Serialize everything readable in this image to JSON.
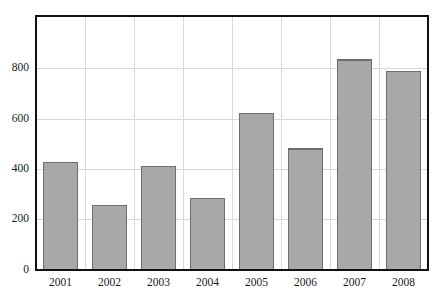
{
  "chart_data": {
    "type": "bar",
    "title": "",
    "subtitle": "",
    "xlabel": "",
    "ylabel": "",
    "categories": [
      "2001",
      "2002",
      "2003",
      "2004",
      "2005",
      "2006",
      "2007",
      "2008"
    ],
    "values": [
      428,
      256,
      412,
      284,
      622,
      480,
      836,
      790
    ],
    "series": [
      {
        "name": "",
        "values": [
          428,
          256,
          412,
          284,
          622,
          480,
          836,
          790
        ]
      }
    ],
    "ylim": [
      0,
      1010
    ],
    "yticks": [
      0,
      200,
      400,
      600,
      800
    ],
    "ytick_labels": [
      "0",
      "200",
      "400",
      "600",
      "800"
    ],
    "xtick_labels": [
      "2001",
      "2002",
      "2003",
      "2004",
      "2005",
      "2006",
      "2007",
      "2008"
    ],
    "grid": true,
    "grid_axis": "both",
    "legend": false,
    "legend_position": "none",
    "annotations": [],
    "colors": {
      "bar_fill": "#a8a8a8",
      "bar_border": "#6e6e6e",
      "gridline": "#d9d9d9",
      "axis": "#111111",
      "text": "#1a1a1a",
      "background": "#ffffff"
    }
  },
  "plot": {
    "left": 36,
    "right": 428,
    "top": 16,
    "bottom": 270,
    "bar_width": 34
  }
}
